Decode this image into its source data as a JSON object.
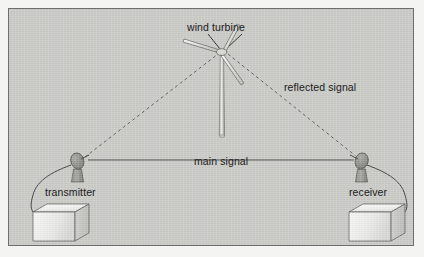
{
  "figure": {
    "title_alt": "Wind turbine interference with a microwave link",
    "background_color": "#f4f4f3",
    "panel_color": "#c9c9c6",
    "panel_border_color": "#6e6e6c",
    "line_color": "#4a4a48",
    "text_color": "#1b1b1b"
  },
  "labels": {
    "wind_turbine": "wind turbine",
    "reflected_signal": "reflected signal",
    "main_signal": "main signal",
    "transmitter": "transmitter",
    "receiver": "receiver"
  },
  "elements": {
    "turbine": {
      "name": "wind-turbine",
      "blades": 3,
      "hub_x": 213,
      "hub_y": 42,
      "tower_base_y": 128
    },
    "transmitter_dish": {
      "name": "transmitter-dish-antenna",
      "x": 68,
      "y": 152
    },
    "receiver_dish": {
      "name": "receiver-dish-antenna",
      "x": 352,
      "y": 152
    },
    "transmitter_box": {
      "name": "transmitter-equipment-box",
      "x": 22,
      "y": 196
    },
    "receiver_box": {
      "name": "receiver-equipment-box",
      "x": 352,
      "y": 196
    }
  },
  "signals": [
    {
      "name": "main-signal-path",
      "style": "solid",
      "from": "transmitter",
      "to": "receiver",
      "label": "main signal"
    },
    {
      "name": "reflected-signal-path-incident",
      "style": "dashed",
      "from": "transmitter",
      "to": "wind turbine"
    },
    {
      "name": "reflected-signal-path-scattered",
      "style": "dashed",
      "from": "wind turbine",
      "to": "receiver",
      "label": "reflected signal"
    }
  ]
}
